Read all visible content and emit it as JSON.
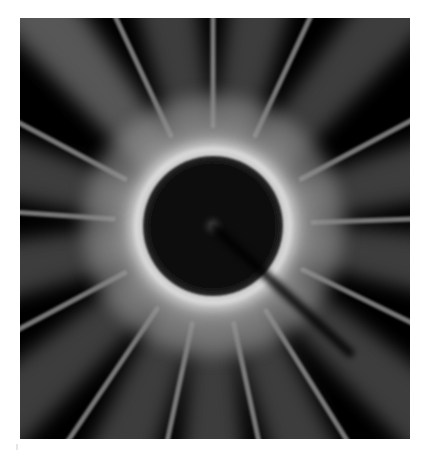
{
  "image": {
    "description": "Grayscale diffraction / scattering pattern",
    "background_color": "#ffffff",
    "frame": {
      "x": 20,
      "y": 18,
      "width": 390,
      "height": 421
    },
    "center": {
      "x": 193,
      "y": 208
    },
    "ring": {
      "inner_radius": 70,
      "bright_radius": 76,
      "outer_radius": 86,
      "color": "#f2f2f2"
    },
    "core_color": "#050505",
    "beam_stop": {
      "from": {
        "x": 195,
        "y": 210
      },
      "to": {
        "x": 330,
        "y": 335
      },
      "width": 9,
      "color": "#000000"
    },
    "sharp_streak_angles_deg": [
      -25,
      0,
      25,
      62,
      88,
      116,
      148,
      168,
      192,
      214,
      242,
      274,
      298
    ],
    "diffuse_beam_angles_deg": [
      -38,
      -12,
      12,
      40,
      75,
      100,
      132,
      158,
      180,
      202,
      228,
      258,
      286,
      320
    ]
  }
}
